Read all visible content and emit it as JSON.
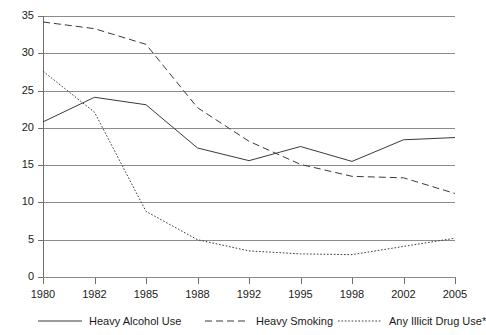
{
  "chart_data": {
    "type": "line",
    "title": "",
    "subtitle": "",
    "xlabel": "",
    "ylabel": "",
    "categories": [
      "1980",
      "1982",
      "1985",
      "1988",
      "1992",
      "1995",
      "1998",
      "2002",
      "2005"
    ],
    "ylim": [
      0,
      35
    ],
    "yticks": [
      0,
      5,
      10,
      15,
      20,
      25,
      30,
      35
    ],
    "ytick_labels": [
      "0",
      "5",
      "10",
      "15",
      "20",
      "25",
      "30",
      "35"
    ],
    "grid": "horizontal",
    "legend_position": "bottom",
    "axis_type": "categorical-evenly-spaced",
    "series": [
      {
        "name": "Heavy Alcohol Use",
        "style": "solid",
        "color": "#3a3a3a",
        "values": [
          20.8,
          24.1,
          23.1,
          17.3,
          15.6,
          17.5,
          15.5,
          18.4,
          18.7
        ]
      },
      {
        "name": "Heavy Smoking",
        "style": "dashed",
        "color": "#3a3a3a",
        "values": [
          34.2,
          33.3,
          31.2,
          22.7,
          18.2,
          15.1,
          13.5,
          13.3,
          11.2
        ]
      },
      {
        "name": "Any Illicit Drug Use*",
        "style": "dotted",
        "color": "#3a3a3a",
        "values": [
          27.6,
          22.1,
          8.8,
          5.0,
          3.5,
          3.1,
          3.0,
          4.1,
          5.2
        ]
      }
    ]
  },
  "legend": {
    "items": [
      {
        "label": "Heavy Alcohol Use",
        "style": "solid"
      },
      {
        "label": "Heavy Smoking",
        "style": "dashed"
      },
      {
        "label": "Any Illicit Drug Use*",
        "style": "dotted"
      }
    ]
  }
}
